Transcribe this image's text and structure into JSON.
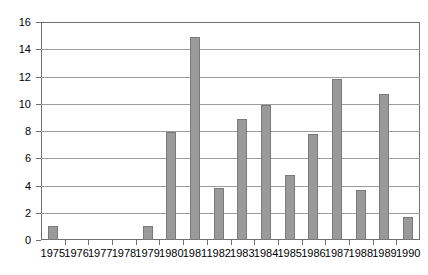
{
  "chart_data": {
    "type": "bar",
    "title": "",
    "subtitle": "",
    "xlabel": "",
    "ylabel": "",
    "categories": [
      "1975",
      "1976",
      "1977",
      "1978",
      "1979",
      "1980",
      "1981",
      "1982",
      "1983",
      "1984",
      "1985",
      "1986",
      "1987",
      "1988",
      "1989",
      "1990"
    ],
    "values": [
      1.0,
      0,
      0,
      0,
      1.0,
      7.9,
      14.9,
      3.8,
      8.9,
      9.9,
      4.8,
      7.8,
      11.8,
      3.7,
      10.7,
      1.7
    ],
    "ylim": [
      0,
      16
    ],
    "ytick_step": 2,
    "yticks": [
      "0",
      "2",
      "4",
      "6",
      "8",
      "10",
      "12",
      "14",
      "16"
    ],
    "grid": "horizontal",
    "legend": "none",
    "series": [
      {
        "name": "",
        "values": [
          1.0,
          0,
          0,
          0,
          1.0,
          7.9,
          14.9,
          3.8,
          8.9,
          9.9,
          4.8,
          7.8,
          11.8,
          3.7,
          10.7,
          1.7
        ],
        "color": "#9a9a9a"
      }
    ],
    "colors": {
      "bar_fill": "#9a9a9a",
      "bar_border": "#7a7a7a",
      "gridline": "#9c9c9c",
      "axis": "#6f6f6f",
      "background": "#ffffff",
      "text": "#000000"
    }
  }
}
